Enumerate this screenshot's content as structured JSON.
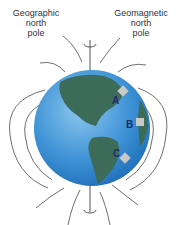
{
  "labels": {
    "geographic_north_pole": [
      "Geographic",
      "north",
      "pole"
    ],
    "geomagnetic_north_pole": [
      "Geomagnetic",
      "north",
      "pole"
    ]
  },
  "points": [
    {
      "id": "A",
      "label": "A"
    },
    {
      "id": "B",
      "label": "B"
    },
    {
      "id": "C",
      "label": "C"
    }
  ],
  "colors": {
    "ocean": "#3f93d6",
    "land": "#3d6b5a",
    "field_line": "#4a4a4a",
    "marker": "#c9c9c9"
  }
}
